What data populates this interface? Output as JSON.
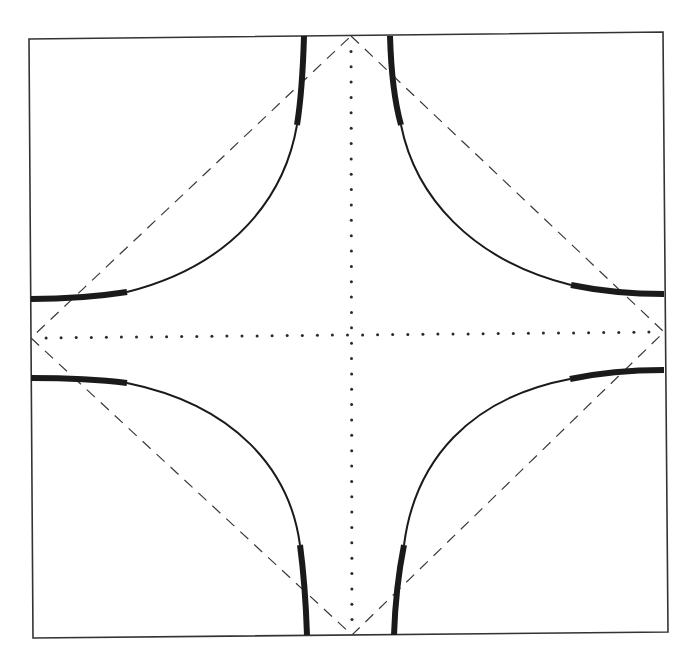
{
  "diagram": {
    "colors": {
      "background": "#ffffff",
      "ink": "#1a1a1a",
      "frame": "#333333",
      "dashed": "#3a3a3a",
      "dotted": "#2a2a2a"
    },
    "frame": {
      "top_left": [
        29,
        39
      ],
      "top_right": [
        663,
        32
      ],
      "bottom_right": [
        668,
        632
      ],
      "bottom_left": [
        33,
        638
      ]
    },
    "center": [
      352,
      335
    ],
    "diamond": {
      "style": "dashed",
      "vertices": [
        [
          351,
          36
        ],
        [
          664,
          332
        ],
        [
          352,
          635
        ],
        [
          31,
          338
        ]
      ]
    },
    "axes": {
      "style": "dotted",
      "vertical": [
        [
          351,
          36
        ],
        [
          352,
          635
        ]
      ],
      "horizontal": [
        [
          31,
          338
        ],
        [
          664,
          332
        ]
      ],
      "dot_spacing": 15
    },
    "curves": [
      {
        "name": "top-left",
        "thin": "M 297 125 C 285 195, 235 265, 127 292",
        "thick": [
          "M 304 36 C 303 70, 301 100, 297 125",
          "M 127 292 C 95 297, 60 299, 31 299"
        ]
      },
      {
        "name": "top-right",
        "thin": "M 401 125 C 415 195, 470 260, 571 285",
        "thick": [
          "M 390 36 C 391 70, 394 100, 401 125",
          "M 571 285 C 605 292, 635 294, 664 294"
        ]
      },
      {
        "name": "bottom-left",
        "thin": "M 127 383 C 235 405, 290 470, 300 545",
        "thick": [
          "M 31 378 C 60 378, 95 379, 127 383",
          "M 300 545 C 304 575, 306 605, 307 635"
        ]
      },
      {
        "name": "bottom-right",
        "thin": "M 570 379 C 470 398, 415 460, 404 545",
        "thick": [
          "M 664 370 C 635 370, 603 372, 570 379",
          "M 404 545 C 398 575, 395 605, 394 635"
        ]
      }
    ]
  }
}
